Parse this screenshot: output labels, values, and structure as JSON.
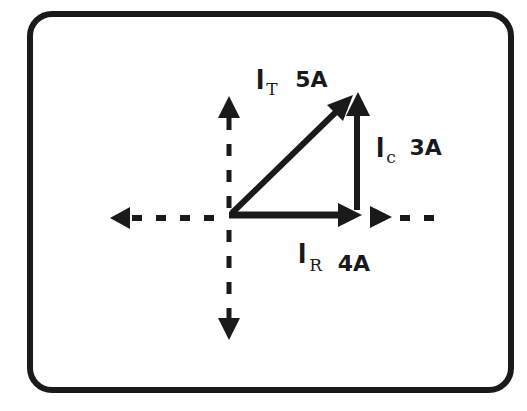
{
  "diagram": {
    "type": "phasor-diagram",
    "frame": {
      "stroke": "#1a1a1a",
      "background": "#ffffff"
    },
    "axes": {
      "style": "dashed",
      "color": "#1a1a1a"
    },
    "vectors": [
      {
        "id": "ir",
        "symbol": "I",
        "subscript": "R",
        "value": "4A",
        "direction": "horizontal"
      },
      {
        "id": "ic",
        "symbol": "I",
        "subscript": "C",
        "value": "3A",
        "direction": "vertical"
      },
      {
        "id": "it",
        "symbol": "I",
        "subscript": "T",
        "value": "5A",
        "direction": "diagonal"
      }
    ]
  }
}
